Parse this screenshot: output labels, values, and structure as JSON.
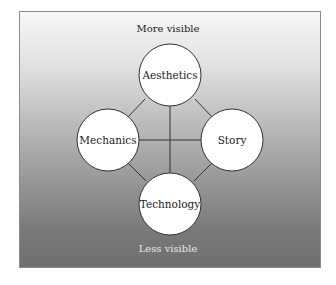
{
  "diagram": {
    "top_label": "More visible",
    "bottom_label": "Less visible",
    "nodes": [
      {
        "id": "aesthetics",
        "label": "Aesthetics"
      },
      {
        "id": "mechanics",
        "label": "Mechanics"
      },
      {
        "id": "story",
        "label": "Story"
      },
      {
        "id": "technology",
        "label": "Technology"
      }
    ],
    "edges": [
      [
        "aesthetics",
        "mechanics"
      ],
      [
        "aesthetics",
        "story"
      ],
      [
        "aesthetics",
        "technology"
      ],
      [
        "mechanics",
        "story"
      ],
      [
        "mechanics",
        "technology"
      ],
      [
        "story",
        "technology"
      ]
    ],
    "colors": {
      "gradient_top": "#f7f7f7",
      "gradient_bottom": "#6f6f6f",
      "node_fill": "#ffffff",
      "line": "#333333"
    }
  }
}
